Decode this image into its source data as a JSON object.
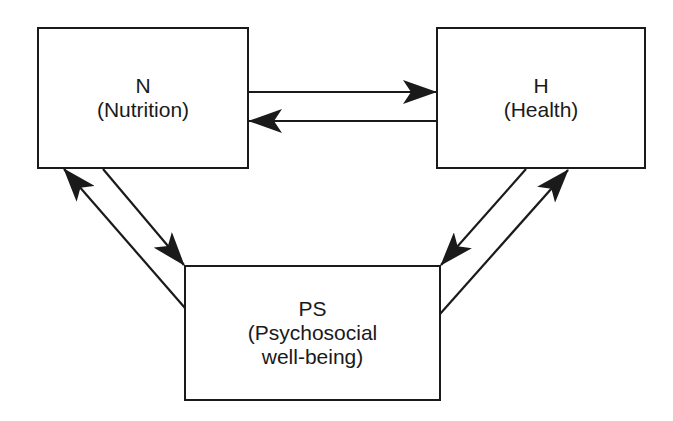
{
  "diagram": {
    "type": "cyclic-relationship",
    "nodes": [
      {
        "id": "N",
        "abbrev": "N",
        "label": "(Nutrition)"
      },
      {
        "id": "H",
        "abbrev": "H",
        "label": "(Health)"
      },
      {
        "id": "PS",
        "abbrev": "PS",
        "label_line1": "(Psychosocial",
        "label_line2": "well-being)"
      }
    ],
    "edges": [
      {
        "from": "N",
        "to": "H"
      },
      {
        "from": "H",
        "to": "N"
      },
      {
        "from": "N",
        "to": "PS"
      },
      {
        "from": "PS",
        "to": "N"
      },
      {
        "from": "H",
        "to": "PS"
      },
      {
        "from": "PS",
        "to": "H"
      }
    ],
    "colors": {
      "stroke": "#1a1a1a",
      "background": "#ffffff"
    }
  }
}
